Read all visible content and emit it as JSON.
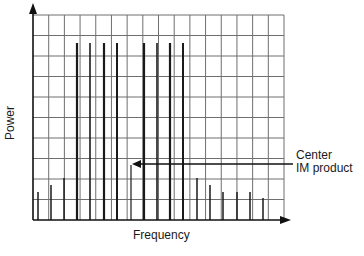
{
  "chart_data": {
    "type": "bar",
    "title": "",
    "xlabel": "Frequency",
    "ylabel": "Power",
    "grid": true,
    "grid_columns": 16,
    "grid_rows": 10,
    "annotation": {
      "line1": "Center",
      "line2": "IM product",
      "target_index": 7
    },
    "lines": [
      {
        "x": 38,
        "top": 192,
        "w": 1.5
      },
      {
        "x": 51,
        "top": 185,
        "w": 1.5
      },
      {
        "x": 64,
        "top": 178,
        "w": 1.5
      },
      {
        "x": 77,
        "top": 43,
        "w": 2.2
      },
      {
        "x": 90,
        "top": 43,
        "w": 1.6
      },
      {
        "x": 104,
        "top": 43,
        "w": 2.2
      },
      {
        "x": 117,
        "top": 43,
        "w": 2
      },
      {
        "x": 131,
        "top": 165,
        "w": 1.2
      },
      {
        "x": 144,
        "top": 43,
        "w": 2.2
      },
      {
        "x": 157,
        "top": 43,
        "w": 1.6
      },
      {
        "x": 170,
        "top": 43,
        "w": 2.2
      },
      {
        "x": 183,
        "top": 43,
        "w": 2
      },
      {
        "x": 197,
        "top": 178,
        "w": 1.5
      },
      {
        "x": 210,
        "top": 185,
        "w": 1.5
      },
      {
        "x": 223,
        "top": 192,
        "w": 1.5
      },
      {
        "x": 237,
        "top": 192,
        "w": 1.5
      },
      {
        "x": 250,
        "top": 192,
        "w": 1.5
      },
      {
        "x": 263,
        "top": 198,
        "w": 1.5
      }
    ],
    "categories": [
      "s1",
      "s2",
      "s3",
      "c1",
      "c2",
      "c3",
      "c4",
      "center-IM",
      "c5",
      "c6",
      "c7",
      "c8",
      "s4",
      "s5",
      "s6",
      "s7",
      "s8",
      "s9"
    ],
    "values": [
      2.8,
      3.1,
      3.4,
      8.4,
      8.4,
      8.4,
      8.4,
      2.7,
      8.4,
      8.4,
      8.4,
      8.4,
      3.4,
      3.1,
      2.8,
      2.8,
      2.8,
      2.5
    ],
    "ylim": [
      0,
      10
    ]
  },
  "colors": {
    "grid": "#6f6f6f",
    "axis": "#111111",
    "line": "#1a1a1a"
  }
}
